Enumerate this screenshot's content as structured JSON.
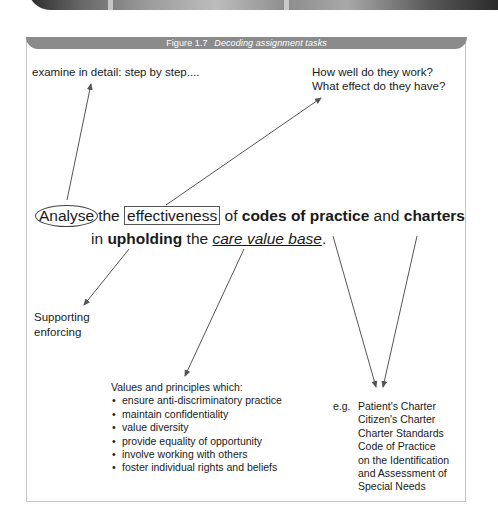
{
  "figure": {
    "number": "Figure 1.7",
    "title": "Decoding assignment tasks"
  },
  "annotations": {
    "analyse_meaning": "examine in detail: step by step....",
    "effectiveness_q1": "How well do they work?",
    "effectiveness_q2": "What effect do they have?",
    "upholding_line1": "Supporting",
    "upholding_line2": "enforcing"
  },
  "task_statement": {
    "w_analyse": "Analyse",
    "w_the1": "the",
    "w_effectiveness": "effectiveness",
    "w_of": "of",
    "w_codes": "codes of practice",
    "w_and": "and",
    "w_charters": "charters",
    "w_in": "in",
    "w_upholding": "upholding",
    "w_the2": "the",
    "w_care": "care value base",
    "w_period": "."
  },
  "values_box": {
    "heading": "Values and principles which:",
    "items": [
      "ensure anti-discriminatory practice",
      "maintain confidentiality",
      "value diversity",
      "provide equality of opportunity",
      "involve working with others",
      "foster individual rights and beliefs"
    ]
  },
  "examples_box": {
    "prefix": "e.g.",
    "lines": [
      "Patient's Charter",
      "Citizen's Charter",
      "Charter Standards",
      "Code of Practice",
      "on the Identification",
      "and Assessment of",
      "Special Needs"
    ]
  },
  "colors": {
    "header_bg": "#8b8b8b",
    "arrow": "#555555",
    "frame_border": "#c4c4c4"
  }
}
